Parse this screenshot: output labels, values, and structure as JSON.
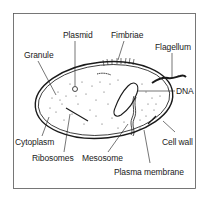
{
  "diagram": {
    "title": "",
    "labels": [
      {
        "id": "plasmid",
        "text": "Plasmid"
      },
      {
        "id": "fimbriae",
        "text": "Fimbriae"
      },
      {
        "id": "flagellum",
        "text": "Flagellum"
      },
      {
        "id": "granule",
        "text": "Granule"
      },
      {
        "id": "dna",
        "text": "DNA"
      },
      {
        "id": "cytoplasm",
        "text": "Cytoplasm"
      },
      {
        "id": "cell-wall",
        "text": "Cell wall"
      },
      {
        "id": "ribosomes",
        "text": "Ribosomes"
      },
      {
        "id": "mesosome",
        "text": "Mesosome"
      },
      {
        "id": "plasma-membrane",
        "text": "Plasma membrane"
      }
    ],
    "colors": {
      "line": "#1a1a1a",
      "background": "#ffffff",
      "frame": "#555555"
    }
  }
}
